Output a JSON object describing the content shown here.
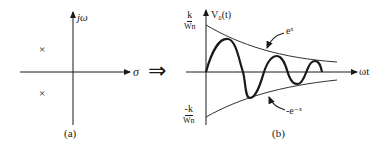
{
  "panel_a": {
    "y_axis_label": "jω",
    "x_axis_label": "σ",
    "caption": "(a)",
    "poles": [
      {
        "symbol": "×",
        "position": "upper-left half-plane"
      },
      {
        "symbol": "×",
        "position": "lower-left half-plane"
      }
    ]
  },
  "transition_arrow": "⇒",
  "panel_b": {
    "y_axis_label": "V₀(t)",
    "x_axis_label": "ωt",
    "caption": "(b)",
    "upper_bound": {
      "numerator": "k",
      "denominator": "Wn"
    },
    "lower_bound": {
      "numerator": "-k",
      "denominator": "Wn"
    },
    "upper_envelope_label": "eˣ",
    "lower_envelope_label": "-e⁻ˣ"
  },
  "colors": {
    "ink": "#1a1a1a",
    "background": "#ffffff"
  }
}
